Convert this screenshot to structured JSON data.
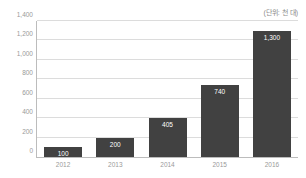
{
  "unit_note": "(단위: 천 대)",
  "colors": {
    "bar": "#414141",
    "gridline": "#dcdcdc",
    "axis": "#bcbcbc",
    "tick_text": "#9a9a9a",
    "value_text": "#ffffff",
    "background": "#ffffff"
  },
  "chart_data": {
    "type": "bar",
    "title": "",
    "subtitle": "",
    "xlabel": "",
    "ylabel": "",
    "annotations": [
      "(단위: 천 대)"
    ],
    "categories": [
      "2012",
      "2013",
      "2014",
      "2015",
      "2016"
    ],
    "values": [
      100,
      200,
      405,
      740,
      1300
    ],
    "value_labels": [
      "100",
      "200",
      "405",
      "740",
      "1,300"
    ],
    "ylim": [
      0,
      1400
    ],
    "yticks": [
      0,
      200,
      400,
      600,
      800,
      1000,
      1200,
      1400
    ],
    "ytick_labels": [
      "0",
      "200",
      "400",
      "600",
      "800",
      "1,000",
      "1,200",
      "1,400"
    ],
    "grid": true,
    "legend": false,
    "legend_position": "none"
  }
}
